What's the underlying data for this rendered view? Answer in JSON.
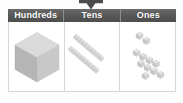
{
  "widget": {
    "type": "place-value-chart",
    "arrow": {
      "icon": "arrow-down-icon",
      "direction": "down",
      "color": "#4a4a4a"
    },
    "header": {
      "background_color": "#5d5d5d",
      "text_color": "#ffffff",
      "columns": [
        {
          "label": "Hundreds"
        },
        {
          "label": "Tens"
        },
        {
          "label": "Ones"
        }
      ]
    },
    "columns": [
      {
        "name": "hundreds",
        "label": "Hundreds",
        "manipulative": "base-ten-block-cube",
        "block_color": "#c9c9c9",
        "count": 1,
        "unit_value": 1000,
        "description": "one large cube built from small unit blocks"
      },
      {
        "name": "tens",
        "label": "Tens",
        "manipulative": "base-ten-rod",
        "block_color": "#c9c9c9",
        "count": 2,
        "unit_value": 10,
        "description": "two diagonal ten-rods"
      },
      {
        "name": "ones",
        "label": "Ones",
        "manipulative": "base-ten-unit-cube",
        "block_color": "#cfcfcf",
        "count": 11,
        "unit_value": 1,
        "description": "eleven loose unit cubes arranged diagonally"
      }
    ]
  }
}
